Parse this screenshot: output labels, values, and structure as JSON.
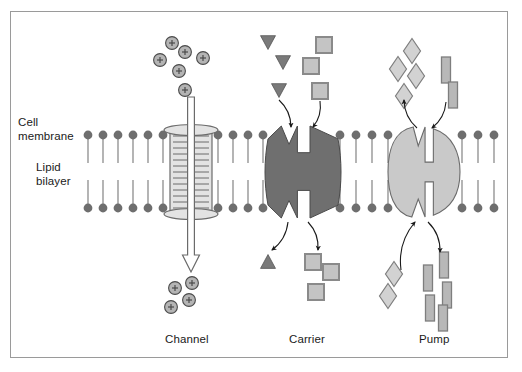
{
  "diagram": {
    "frame": {
      "x": 10,
      "y": 11,
      "w": 498,
      "h": 347,
      "border_color": "#9a9a9a",
      "background": "#ffffff"
    },
    "labels": {
      "cell_membrane_line1": "Cell",
      "cell_membrane_line2": "membrane",
      "lipid_bilayer_line1": "Lipid",
      "lipid_bilayer_line2": "bilayer",
      "channel": "Channel",
      "carrier": "Carrier",
      "pump": "Pump"
    },
    "label_positions": {
      "cell_membrane": {
        "x": 18,
        "y": 115
      },
      "lipid_bilayer": {
        "x": 36,
        "y": 160
      },
      "channel": {
        "x": 165,
        "y": 332
      },
      "carrier": {
        "x": 289,
        "y": 332
      },
      "pump": {
        "x": 419,
        "y": 332
      }
    },
    "colors": {
      "lipid_head": "#6e6e6e",
      "lipid_tail": "#8d8d8d",
      "channel_fill": "#e3e3e3",
      "channel_stroke": "#6b6b6b",
      "carrier_fill": "#6f6f6f",
      "carrier_stroke": "#4a4a4a",
      "pump_fill": "#c9c9c9",
      "pump_stroke": "#6b6b6b",
      "ion_fill": "#b4b4b4",
      "ion_stroke": "#4a4a4a",
      "triangle_fill": "#7a7a7a",
      "square_fill": "#c4c4c4",
      "square_stroke": "#8a8a8a",
      "diamond_fill": "#d2d2d2",
      "diamond_stroke": "#7e7e7e",
      "bar_fill": "#b8b8b8",
      "bar_stroke": "#7e7e7e",
      "arrow_dark": "#1a1a1a",
      "arrow_hollow_fill": "#ffffff",
      "text": "#1a1a1a"
    },
    "membrane": {
      "upper_head_y": 135,
      "lower_head_y": 208,
      "head_radius": 4.4,
      "tail_length": 28,
      "segments": [
        {
          "name": "left",
          "x_positions": [
            88,
            103,
            118,
            133,
            148,
            163
          ]
        },
        {
          "name": "between-channel-and-carrier",
          "x_positions": [
            218,
            233,
            248,
            263
          ]
        },
        {
          "name": "between-carrier-and-pump",
          "x_positions": [
            340,
            356,
            372,
            388
          ]
        },
        {
          "name": "right",
          "x_positions": [
            462,
            478,
            494
          ]
        }
      ]
    },
    "proteins": [
      {
        "name": "channel",
        "type": "spool-cylinder",
        "cx": 191,
        "top_y": 130,
        "bottom_y": 214,
        "body_width": 42,
        "flange_width": 54,
        "striation_count": 13,
        "arrow": {
          "direction": "down",
          "style": "hollow-outline",
          "x": 191,
          "from_y": 97,
          "to_y": 272
        }
      },
      {
        "name": "carrier",
        "type": "notched-blob",
        "cx": 303,
        "cy": 172,
        "rx": 35,
        "ry": 46,
        "notch_top": true,
        "notch_bottom": true
      },
      {
        "name": "pump",
        "type": "notched-circle",
        "cx": 424,
        "cy": 172,
        "rx": 36,
        "ry": 45,
        "notch_top": true,
        "notch_bottom": true,
        "central_slot": true
      }
    ],
    "particles": {
      "channel_ions_above": {
        "glyph": "+",
        "shape": "circle",
        "count": 6,
        "positions": [
          {
            "x": 172,
            "y": 43
          },
          {
            "x": 185,
            "y": 52
          },
          {
            "x": 160,
            "y": 60
          },
          {
            "x": 203,
            "y": 58
          },
          {
            "x": 179,
            "y": 71
          },
          {
            "x": 185,
            "y": 90
          }
        ]
      },
      "channel_ions_below": {
        "glyph": "+",
        "shape": "circle",
        "count": 4,
        "positions": [
          {
            "x": 175,
            "y": 288
          },
          {
            "x": 192,
            "y": 283
          },
          {
            "x": 189,
            "y": 300
          },
          {
            "x": 171,
            "y": 307
          }
        ]
      },
      "carrier_triangles_above": {
        "shape": "triangle-down",
        "count": 3,
        "positions": [
          {
            "x": 268,
            "y": 42
          },
          {
            "x": 283,
            "y": 62
          },
          {
            "x": 279,
            "y": 90
          }
        ]
      },
      "carrier_triangle_below": {
        "shape": "triangle-up",
        "count": 1,
        "positions": [
          {
            "x": 268,
            "y": 262
          }
        ]
      },
      "carrier_squares_above": {
        "shape": "square",
        "count": 3,
        "positions": [
          {
            "x": 324,
            "y": 45
          },
          {
            "x": 311,
            "y": 66
          },
          {
            "x": 320,
            "y": 91
          }
        ]
      },
      "carrier_squares_below": {
        "shape": "square",
        "count": 3,
        "positions": [
          {
            "x": 313,
            "y": 262
          },
          {
            "x": 331,
            "y": 272
          },
          {
            "x": 316,
            "y": 292
          }
        ]
      },
      "pump_diamonds_above": {
        "shape": "diamond",
        "count": 4,
        "positions": [
          {
            "x": 412,
            "y": 51
          },
          {
            "x": 398,
            "y": 69
          },
          {
            "x": 416,
            "y": 76
          },
          {
            "x": 404,
            "y": 96
          }
        ]
      },
      "pump_diamonds_below": {
        "shape": "diamond",
        "count": 2,
        "positions": [
          {
            "x": 394,
            "y": 274
          },
          {
            "x": 388,
            "y": 296
          }
        ]
      },
      "pump_bars_above": {
        "shape": "bar-vertical",
        "count": 2,
        "positions": [
          {
            "x": 446,
            "y": 70
          },
          {
            "x": 453,
            "y": 95
          }
        ]
      },
      "pump_bars_below": {
        "shape": "bar-vertical",
        "count": 5,
        "positions": [
          {
            "x": 444,
            "y": 265
          },
          {
            "x": 428,
            "y": 278
          },
          {
            "x": 447,
            "y": 295
          },
          {
            "x": 430,
            "y": 308
          },
          {
            "x": 443,
            "y": 318
          }
        ]
      }
    },
    "flow_arrows": [
      {
        "name": "triangle-in-arrow",
        "from": [
          279,
          100
        ],
        "to": [
          291,
          127
        ],
        "direction": "down-right"
      },
      {
        "name": "square-in-arrow",
        "from": [
          320,
          101
        ],
        "to": [
          313,
          127
        ],
        "direction": "down-left"
      },
      {
        "name": "triangle-out-arrow",
        "from": [
          288,
          222
        ],
        "to": [
          272,
          250
        ],
        "direction": "down-left"
      },
      {
        "name": "square-out-arrow",
        "from": [
          308,
          222
        ],
        "to": [
          318,
          250
        ],
        "direction": "down-right"
      },
      {
        "name": "diamond-out-arrow",
        "from": [
          417,
          128
        ],
        "to": [
          404,
          100
        ],
        "direction": "up-left"
      },
      {
        "name": "bar-in-arrow",
        "from": [
          446,
          102
        ],
        "to": [
          432,
          128
        ],
        "direction": "down-left"
      },
      {
        "name": "diamond-in-arrow",
        "from": [
          401,
          270
        ],
        "to": [
          415,
          222
        ],
        "direction": "up-right"
      },
      {
        "name": "bar-out-arrow",
        "from": [
          428,
          222
        ],
        "to": [
          440,
          252
        ],
        "direction": "down-right"
      }
    ]
  }
}
